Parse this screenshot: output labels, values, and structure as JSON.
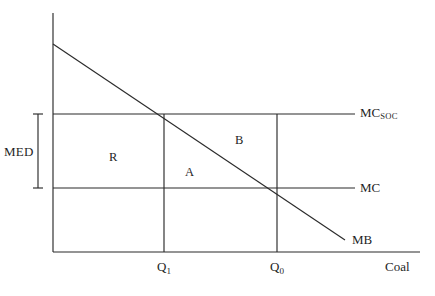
{
  "figure": {
    "kind": "economics-externality-diagram",
    "background_color": "#ffffff",
    "line_color": "#2b2b2b",
    "text_color": "#1f1f1f"
  },
  "axes": {
    "x_axis_label": "Coal",
    "y_axis_label": "",
    "origin_px": [
      53,
      252
    ],
    "x_axis_end_px": [
      420,
      252
    ],
    "y_axis_top_px": [
      53,
      13
    ]
  },
  "curves": [
    {
      "id": "mc-soc",
      "label_main": "MC",
      "label_sub": "SOC",
      "type": "horizontal",
      "y_px": 114,
      "x_start_px": 53,
      "x_end_px": 355,
      "label_x_px": 360,
      "label_y_px": 107
    },
    {
      "id": "mc",
      "label_main": "MC",
      "label_sub": "",
      "type": "horizontal",
      "y_px": 188,
      "x_start_px": 53,
      "x_end_px": 355,
      "label_x_px": 360,
      "label_y_px": 182
    },
    {
      "id": "mb",
      "label_main": "MB",
      "label_sub": "",
      "type": "downward-sloping",
      "start_px": [
        53,
        44
      ],
      "end_px": [
        345,
        240
      ],
      "label_x_px": 352,
      "label_y_px": 234
    }
  ],
  "quantity_lines": [
    {
      "id": "q1",
      "label_main": "Q",
      "label_sub": "1",
      "x_px": 164,
      "y_top_px": 114,
      "y_bottom_px": 252,
      "label_x_px": 157,
      "label_y_px": 262
    },
    {
      "id": "q0",
      "label_main": "Q",
      "label_sub": "0",
      "x_px": 277,
      "y_top_px": 114,
      "y_bottom_px": 252,
      "label_x_px": 270,
      "label_y_px": 262
    }
  ],
  "bracket": {
    "id": "med",
    "label": "MED",
    "x_px": 38,
    "y_top_px": 114,
    "y_bottom_px": 188,
    "cap_half_width_px": 5,
    "label_x_px": 4,
    "label_y_px": 145
  },
  "regions": [
    {
      "id": "region-r",
      "label": "R",
      "x_px": 109,
      "y_px": 151
    },
    {
      "id": "region-a",
      "label": "A",
      "x_px": 185,
      "y_px": 166
    },
    {
      "id": "region-b",
      "label": "B",
      "x_px": 235,
      "y_px": 134
    }
  ]
}
